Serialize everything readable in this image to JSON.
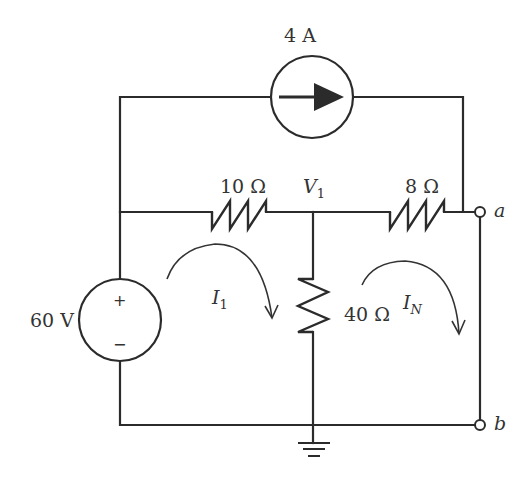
{
  "diagram": {
    "type": "electrical-circuit",
    "sources": {
      "current_source": {
        "label": "4 A",
        "direction": "left-to-right"
      },
      "voltage_source": {
        "label": "60 V",
        "plus": "+",
        "minus": "−"
      }
    },
    "resistors": {
      "r1": {
        "label": "10 Ω"
      },
      "r2": {
        "label": "8 Ω"
      },
      "r3": {
        "label": "40 Ω"
      }
    },
    "nodes": {
      "v1": {
        "name": "V",
        "sub": "1"
      },
      "terminal_a": {
        "label": "a"
      },
      "terminal_b": {
        "label": "b"
      }
    },
    "mesh_currents": {
      "i1": {
        "name": "I",
        "sub": "1",
        "direction": "clockwise"
      },
      "in": {
        "name": "I",
        "sub": "N",
        "direction": "clockwise"
      }
    },
    "ground": {
      "symbol": "ground"
    }
  }
}
